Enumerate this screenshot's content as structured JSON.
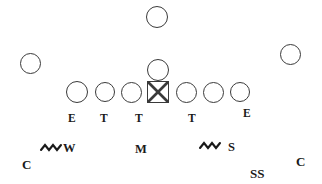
{
  "diagram": {
    "width": 322,
    "height": 184,
    "background_color": "#ffffff",
    "stroke_color": "#3a3a3a",
    "text_color": "#1a1a1a"
  },
  "chart_data": {
    "type": "diagram",
    "markers": [
      {
        "id": "deep-back",
        "shape": "circle",
        "x": 157,
        "y": 17,
        "r": 11,
        "label": ""
      },
      {
        "id": "left-wide",
        "shape": "circle",
        "x": 30,
        "y": 63,
        "r": 10.5,
        "label": ""
      },
      {
        "id": "right-wide",
        "shape": "circle",
        "x": 290,
        "y": 54,
        "r": 10.5,
        "label": ""
      },
      {
        "id": "quarterback",
        "shape": "circle",
        "x": 158,
        "y": 70,
        "r": 11,
        "label": ""
      },
      {
        "id": "line-1",
        "shape": "circle",
        "x": 77,
        "y": 92,
        "r": 11,
        "label": "E"
      },
      {
        "id": "line-2",
        "shape": "circle",
        "x": 105,
        "y": 92,
        "r": 10,
        "label": "T"
      },
      {
        "id": "line-3",
        "shape": "circle",
        "x": 131,
        "y": 92,
        "r": 10.5,
        "label": "T"
      },
      {
        "id": "center",
        "shape": "square",
        "x": 158,
        "y": 92,
        "r": 11,
        "label": ""
      },
      {
        "id": "line-5",
        "shape": "circle",
        "x": 186,
        "y": 92,
        "r": 10.5,
        "label": "T"
      },
      {
        "id": "line-6",
        "shape": "circle",
        "x": 213,
        "y": 92,
        "r": 10.5,
        "label": ""
      },
      {
        "id": "line-7",
        "shape": "circle",
        "x": 240,
        "y": 92,
        "r": 10,
        "label": "E"
      }
    ],
    "line_labels": [
      {
        "text": "E",
        "x": 68,
        "y": 113
      },
      {
        "text": "T",
        "x": 100,
        "y": 113
      },
      {
        "text": "T",
        "x": 135,
        "y": 113
      },
      {
        "text": "T",
        "x": 188,
        "y": 113
      },
      {
        "text": "E",
        "x": 243,
        "y": 108
      }
    ],
    "linebackers": [
      {
        "text": "W",
        "x": 63,
        "y": 142,
        "squiggle": true,
        "squiggle_x": 40,
        "squiggle_y": 143
      },
      {
        "text": "M",
        "x": 135,
        "y": 143,
        "squiggle": false
      },
      {
        "text": "S",
        "x": 228,
        "y": 141,
        "squiggle": true,
        "squiggle_x": 199,
        "squiggle_y": 141
      }
    ],
    "defensive_backs": [
      {
        "text": "C",
        "x": 22,
        "y": 158
      },
      {
        "text": "SS",
        "x": 250,
        "y": 167
      },
      {
        "text": "C",
        "x": 296,
        "y": 155
      }
    ]
  }
}
